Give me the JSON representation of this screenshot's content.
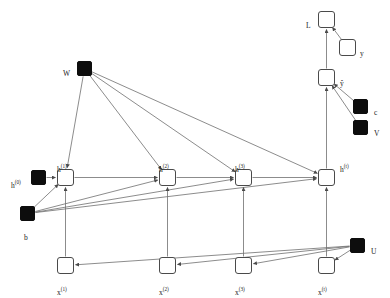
{
  "diagram": {
    "colors": {
      "node_fill_open": "#ffffff",
      "node_stroke": "#4a4a4a",
      "node_fill_parameter": "#0d0d0d",
      "edge": "#6e6e6e",
      "label_text": "#1a1a1a",
      "background": "#ffffff"
    },
    "nodes": [
      {
        "id": "L",
        "label": "L",
        "label_html": "L",
        "type": "state",
        "shape": "square-open",
        "x": 318,
        "y": 11,
        "w": 17,
        "h": 17,
        "label_x": 306,
        "label_y": 22
      },
      {
        "id": "y",
        "label": "y",
        "label_html": "y",
        "type": "state",
        "shape": "square-open",
        "x": 339,
        "y": 39,
        "w": 17,
        "h": 17,
        "label_x": 360,
        "label_y": 50
      },
      {
        "id": "yhat",
        "label": "ŷ",
        "label_html": "<span class=\"hat\">ŷ</span>",
        "type": "state",
        "shape": "square-open",
        "x": 318,
        "y": 69,
        "w": 17,
        "h": 17,
        "label_x": 340,
        "label_y": 80
      },
      {
        "id": "c",
        "label": "c",
        "label_html": "c",
        "type": "parameter",
        "shape": "square-filled",
        "x": 353,
        "y": 99,
        "w": 15,
        "h": 15,
        "label_x": 374,
        "label_y": 109
      },
      {
        "id": "V",
        "label": "V",
        "label_html": "V",
        "type": "parameter",
        "shape": "square-filled",
        "x": 353,
        "y": 120,
        "w": 15,
        "h": 15,
        "label_x": 374,
        "label_y": 130
      },
      {
        "id": "W",
        "label": "W",
        "label_html": "W",
        "type": "parameter",
        "shape": "square-filled",
        "x": 77,
        "y": 61,
        "w": 15,
        "h": 15,
        "label_x": 63,
        "label_y": 70
      },
      {
        "id": "b",
        "label": "b",
        "label_html": "b",
        "type": "parameter",
        "shape": "square-filled",
        "x": 20,
        "y": 206,
        "w": 15,
        "h": 15,
        "label_x": 24,
        "label_y": 234
      },
      {
        "id": "U",
        "label": "U",
        "label_html": "U",
        "type": "parameter",
        "shape": "square-filled",
        "x": 350,
        "y": 238,
        "w": 15,
        "h": 15,
        "label_x": 371,
        "label_y": 248
      },
      {
        "id": "h0",
        "label": "h(0)",
        "label_html": "h<sup>(0)</sup>",
        "type": "parameter",
        "shape": "square-filled",
        "x": 31,
        "y": 170,
        "w": 15,
        "h": 15,
        "label_x": 11,
        "label_y": 180
      },
      {
        "id": "h1",
        "label": "h(1)",
        "label_html": "h<sup>(1)</sup>",
        "type": "state",
        "shape": "square-open",
        "x": 57,
        "y": 169,
        "w": 17,
        "h": 17,
        "label_x": 57,
        "label_y": 164
      },
      {
        "id": "h2",
        "label": "h(2)",
        "label_html": "h<sup>(2)</sup>",
        "type": "state",
        "shape": "square-open",
        "x": 159,
        "y": 169,
        "w": 17,
        "h": 17,
        "label_x": 159,
        "label_y": 164
      },
      {
        "id": "h3",
        "label": "h(3)",
        "label_html": "h<sup>(3)</sup>",
        "type": "state",
        "shape": "square-open",
        "x": 235,
        "y": 169,
        "w": 17,
        "h": 17,
        "label_x": 235,
        "label_y": 164
      },
      {
        "id": "ht",
        "label": "h(t)",
        "label_html": "h<sup>(t)</sup>",
        "type": "state",
        "shape": "square-open",
        "x": 318,
        "y": 169,
        "w": 17,
        "h": 17,
        "label_x": 340,
        "label_y": 164
      },
      {
        "id": "x1",
        "label": "x(1)",
        "label_html": "x<sup>(1)</sup>",
        "type": "input",
        "shape": "square-open",
        "x": 57,
        "y": 257,
        "w": 17,
        "h": 17,
        "label_x": 57,
        "label_y": 287
      },
      {
        "id": "x2",
        "label": "x(2)",
        "label_html": "x<sup>(2)</sup>",
        "type": "input",
        "shape": "square-open",
        "x": 159,
        "y": 257,
        "w": 17,
        "h": 17,
        "label_x": 159,
        "label_y": 287
      },
      {
        "id": "x3",
        "label": "x(3)",
        "label_html": "x<sup>(3)</sup>",
        "type": "input",
        "shape": "square-open",
        "x": 235,
        "y": 257,
        "w": 17,
        "h": 17,
        "label_x": 235,
        "label_y": 287
      },
      {
        "id": "x4",
        "label": "x(t)",
        "label_html": "x<sup>(t)</sup>",
        "type": "input",
        "shape": "square-open",
        "x": 318,
        "y": 257,
        "w": 17,
        "h": 17,
        "label_x": 318,
        "label_y": 287
      }
    ],
    "edges": [
      {
        "from": "y",
        "to": "L",
        "kind": "straight"
      },
      {
        "from": "yhat",
        "to": "L",
        "kind": "straight"
      },
      {
        "from": "ht",
        "to": "yhat",
        "kind": "straight"
      },
      {
        "from": "c",
        "to": "yhat",
        "kind": "straight"
      },
      {
        "from": "V",
        "to": "yhat",
        "kind": "straight"
      },
      {
        "from": "h0",
        "to": "h1",
        "kind": "straight"
      },
      {
        "from": "h1",
        "to": "h2",
        "kind": "straight"
      },
      {
        "from": "h2",
        "to": "h3",
        "kind": "straight"
      },
      {
        "from": "h3",
        "to": "ht",
        "kind": "straight"
      },
      {
        "from": "W",
        "to": "h1",
        "kind": "straight"
      },
      {
        "from": "W",
        "to": "h2",
        "kind": "straight"
      },
      {
        "from": "W",
        "to": "h3",
        "kind": "straight"
      },
      {
        "from": "W",
        "to": "ht",
        "kind": "straight"
      },
      {
        "from": "b",
        "to": "h1",
        "kind": "straight"
      },
      {
        "from": "b",
        "to": "h2",
        "kind": "straight"
      },
      {
        "from": "b",
        "to": "h3",
        "kind": "straight"
      },
      {
        "from": "b",
        "to": "ht",
        "kind": "straight"
      },
      {
        "from": "x1",
        "to": "h1",
        "kind": "straight"
      },
      {
        "from": "x2",
        "to": "h2",
        "kind": "straight"
      },
      {
        "from": "x3",
        "to": "h3",
        "kind": "straight"
      },
      {
        "from": "x4",
        "to": "ht",
        "kind": "straight"
      },
      {
        "from": "U",
        "to": "x1",
        "kind": "straight"
      },
      {
        "from": "U",
        "to": "x2",
        "kind": "straight"
      },
      {
        "from": "U",
        "to": "x3",
        "kind": "straight"
      },
      {
        "from": "U",
        "to": "x4",
        "kind": "straight"
      }
    ]
  }
}
